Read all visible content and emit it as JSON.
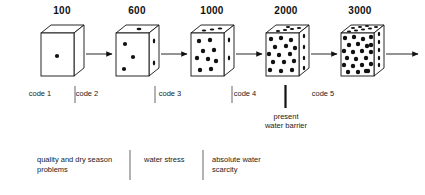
{
  "figure": {
    "type": "process-diagram",
    "title_visible": false,
    "ink_color": "#000000",
    "text_color": "#222222"
  },
  "scale_labels": [
    {
      "value": "100",
      "x": 62
    },
    {
      "value": "600",
      "x": 137
    },
    {
      "value": "1000",
      "x": 212
    },
    {
      "value": "2000",
      "x": 286
    },
    {
      "value": "3000",
      "x": 360
    }
  ],
  "cubes": [
    {
      "id": "cube-1",
      "label": "100",
      "dot_count": 1
    },
    {
      "id": "cube-2",
      "label": "600",
      "dot_count": 6
    },
    {
      "id": "cube-3",
      "label": "1000",
      "dot_count": 14
    },
    {
      "id": "cube-4",
      "label": "2000",
      "dot_count": 24
    },
    {
      "id": "cube-5",
      "label": "3000",
      "dot_count": 36
    }
  ],
  "arrows": [
    {
      "id": "arrow-1",
      "from": "cube-1",
      "to": "cube-2"
    },
    {
      "id": "arrow-2",
      "from": "cube-2",
      "to": "cube-3"
    },
    {
      "id": "arrow-3",
      "from": "cube-3",
      "to": "cube-4"
    },
    {
      "id": "arrow-4",
      "from": "cube-4",
      "to": "cube-5"
    },
    {
      "id": "arrow-5",
      "from": "cube-5",
      "to": "open-end"
    }
  ],
  "code_row": {
    "items": [
      {
        "label": "code 1",
        "x": 10
      },
      {
        "label": "code 2",
        "x": 57
      },
      {
        "label": "code 3",
        "x": 140
      },
      {
        "label": "code 4",
        "x": 215
      },
      {
        "label": "code 5",
        "x": 293
      }
    ],
    "dividers_x": [
      75,
      155,
      232,
      310
    ],
    "barrier_divider_x": 285
  },
  "barrier_note": {
    "line1": "present",
    "line2": "water barrier"
  },
  "categories": [
    {
      "label": "quality and dry season\nproblems",
      "x": 37
    },
    {
      "label": "water stress",
      "x": 144
    },
    {
      "label": "absolute water\nscarcity",
      "x": 212
    }
  ],
  "category_dividers_x": [
    130,
    203
  ]
}
